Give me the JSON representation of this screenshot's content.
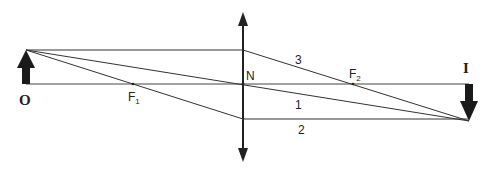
{
  "diagram": {
    "type": "ray-diagram-converging-lens",
    "labels": {
      "object": "O",
      "image": "I",
      "optical_center": "N",
      "focus_1": "F",
      "focus_1_sub": "1",
      "focus_2": "F",
      "focus_2_sub": "2",
      "ray_1": "1",
      "ray_2": "2",
      "ray_3": "3"
    },
    "colors": {
      "line": "#333333",
      "arrow": "#1a1a1a",
      "background": "#ffffff"
    }
  }
}
